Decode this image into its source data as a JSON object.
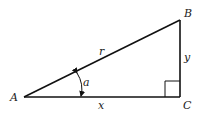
{
  "diagram": {
    "type": "right-triangle",
    "vertices": {
      "A": {
        "label": "A"
      },
      "B": {
        "label": "B"
      },
      "C": {
        "label": "C"
      }
    },
    "sides": {
      "hypotenuse": {
        "label": "r"
      },
      "adjacent": {
        "label": "x"
      },
      "opposite": {
        "label": "y"
      }
    },
    "angle": {
      "label": "a",
      "at_vertex": "A"
    },
    "right_angle_at": "C",
    "colors": {
      "stroke": "#111111",
      "background": "#ffffff"
    }
  }
}
